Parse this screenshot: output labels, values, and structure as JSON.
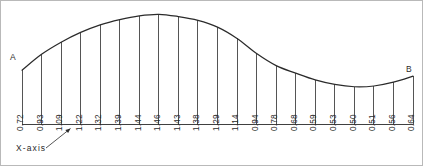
{
  "figure": {
    "title": "",
    "start_label": "A",
    "end_label": "B",
    "axis_caption": "X-axis",
    "line_color": "#2b2b2b",
    "text_color": "#2b2b2b",
    "frame_color": "#b9b9b9",
    "background": "#ffffff"
  },
  "chart_data": {
    "type": "area",
    "title": "",
    "xlabel": "X-axis",
    "ylabel": "",
    "grid": false,
    "legend": null,
    "annotations": [
      {
        "text": "A",
        "position": "left end of curve"
      },
      {
        "text": "B",
        "position": "right end of curve"
      },
      {
        "text": "X-axis",
        "position": "below baseline, arrow to baseline"
      }
    ],
    "x": [
      0,
      1,
      2,
      3,
      4,
      5,
      6,
      7,
      8,
      9,
      10,
      11,
      12,
      13,
      14,
      15,
      16,
      17,
      18,
      19,
      20
    ],
    "values": [
      0.72,
      0.93,
      1.09,
      1.22,
      1.32,
      1.39,
      1.44,
      1.46,
      1.43,
      1.38,
      1.29,
      1.14,
      0.94,
      0.78,
      0.68,
      0.59,
      0.53,
      0.5,
      0.51,
      0.56,
      0.64
    ],
    "ylim": [
      0,
      1.46
    ],
    "xlim": [
      0,
      20
    ],
    "ordinate_count": 21,
    "interval_count": 20
  }
}
